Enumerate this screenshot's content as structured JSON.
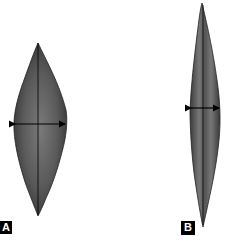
{
  "figure": {
    "panels": [
      {
        "id": "A",
        "label": "A",
        "description": "broad spindle-shaped leaf outline with width measurement arrow"
      },
      {
        "id": "B",
        "label": "B",
        "description": "narrow elongated spindle-shaped leaf outline with width measurement arrow"
      }
    ],
    "colors": {
      "fill": "#4a4a4a",
      "highlight": "#8a8a8a",
      "line": "#000000",
      "label_bg": "#000000",
      "label_fg": "#ffffff"
    }
  }
}
